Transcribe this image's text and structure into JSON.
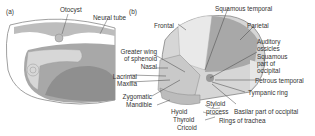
{
  "panels": {
    "a": {
      "tag": "(a)",
      "labels": {
        "otocyst": "Otocyst",
        "neural_tube": "Neural tube"
      }
    },
    "b": {
      "tag": "(b)",
      "labels": {
        "frontal": "Frontal",
        "squamous_temporal": "Squamous temporal",
        "parietal": "Parietal",
        "auditory_1": "Auditory",
        "auditory_2": "ossicles",
        "squamous_occ_1": "Squamous",
        "squamous_occ_2": "part of",
        "squamous_occ_3": "occipital",
        "petrous_temporal": "Petrous temporal",
        "tympanic_ring": "Tympanic ring",
        "greater_wing_1": "Greater wing",
        "greater_wing_2": "of sphenoid",
        "nasal": "Nasal",
        "lacrimal": "Lacrimal",
        "maxilla": "Maxilla",
        "zygomatic": "Zygomatic",
        "mandible": "Mandible",
        "styloid_1": "Styloid",
        "styloid_2": "process",
        "basilar": "Basilar part of occipital",
        "hyoid": "Hyoid",
        "thyroid": "Thyroid",
        "cricoid": "Cricoid",
        "rings_trachea": "Rings of trachea"
      }
    }
  },
  "colors": {
    "dark_grey": "#9a9a9a",
    "mid_grey": "#bdbdbd",
    "light_grey": "#d9d9d9",
    "outline": "#666666"
  }
}
